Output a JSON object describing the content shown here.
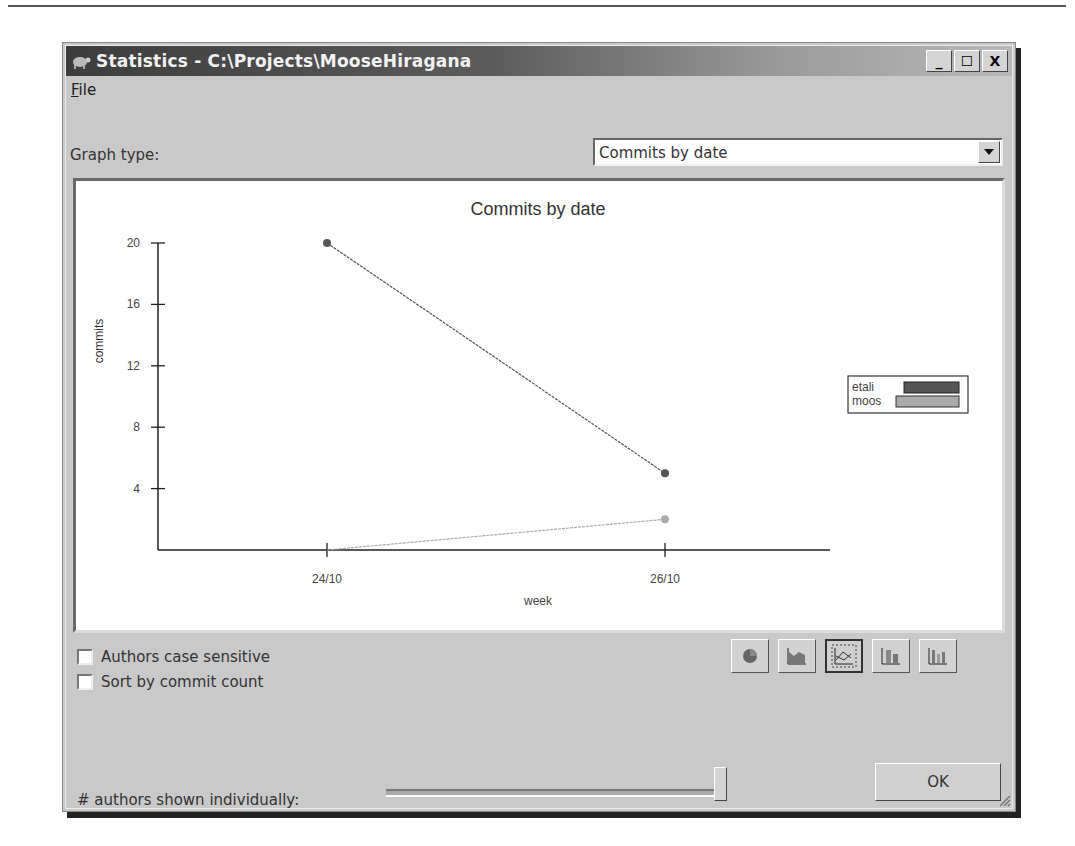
{
  "window": {
    "title": "Statistics - C:\\Projects\\MooseHiragana",
    "controls": {
      "minimize": "_",
      "maximize": "☐",
      "close": "X"
    }
  },
  "menu": {
    "items": [
      {
        "label": "File",
        "mnemonic": "F",
        "rest": "ile"
      }
    ]
  },
  "graph_type": {
    "label": "Graph type:",
    "selected": "Commits by date"
  },
  "options": {
    "authors_case_sensitive": {
      "label": "Authors case sensitive",
      "checked": false
    },
    "sort_by_commit_count": {
      "label": "Sort by commit count",
      "checked": false
    }
  },
  "chart_type_buttons": [
    {
      "name": "pie-chart",
      "active": false
    },
    {
      "name": "area-chart",
      "active": false
    },
    {
      "name": "line-chart",
      "active": true
    },
    {
      "name": "stacked-bar-chart",
      "active": false
    },
    {
      "name": "bar-chart",
      "active": false
    }
  ],
  "slider": {
    "label": "# authors shown individually:",
    "position_pct": 100
  },
  "ok_label": "OK",
  "chart_data": {
    "type": "line",
    "title": "Commits by date",
    "xlabel": "week",
    "ylabel": "commits",
    "categories": [
      "24/10",
      "26/10"
    ],
    "series": [
      {
        "name": "etali",
        "values": [
          20,
          5
        ],
        "color": "#555555"
      },
      {
        "name": "moos",
        "values": [
          0,
          2
        ],
        "color": "#aaaaaa"
      }
    ],
    "yticks": [
      4,
      8,
      12,
      16,
      20
    ],
    "ylim": [
      0,
      20
    ],
    "grid": false,
    "legend_position": "right"
  },
  "legend": {
    "entries": [
      "etali",
      "moos"
    ]
  }
}
